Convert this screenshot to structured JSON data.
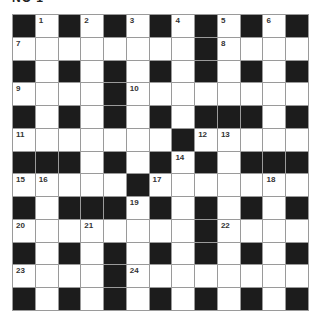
{
  "title": "NO 1",
  "colors": {
    "block": "#1c1c1c",
    "cell": "#ffffff",
    "gridline": "#9a9a9a"
  },
  "grid": {
    "rows": 13,
    "cols": 13,
    "pattern": [
      "BWBWBWBWBWBWB",
      "WWWWWWWWBWWWW",
      "BWBWBWBWBWBWB",
      "WWWWBWWWWWWWW",
      "BWBWBWBWBBBWB",
      "WWWWWWWBWWWWW",
      "BBBWBWBWBWBBB",
      "WWWWWBWWWWWWW",
      "BWBBBWBWBWBWB",
      "WWWWWWWWBWWWW",
      "BWBWBWBWBWBWB",
      "WWWWBWWWWWWWW",
      "BWBWBWBWBWBWB"
    ],
    "numbers": [
      {
        "n": "1",
        "r": 0,
        "c": 1
      },
      {
        "n": "2",
        "r": 0,
        "c": 3
      },
      {
        "n": "3",
        "r": 0,
        "c": 5
      },
      {
        "n": "4",
        "r": 0,
        "c": 7
      },
      {
        "n": "5",
        "r": 0,
        "c": 9
      },
      {
        "n": "6",
        "r": 0,
        "c": 11
      },
      {
        "n": "7",
        "r": 1,
        "c": 0
      },
      {
        "n": "8",
        "r": 1,
        "c": 9
      },
      {
        "n": "9",
        "r": 3,
        "c": 0
      },
      {
        "n": "10",
        "r": 3,
        "c": 5
      },
      {
        "n": "11",
        "r": 5,
        "c": 0
      },
      {
        "n": "12",
        "r": 5,
        "c": 8
      },
      {
        "n": "13",
        "r": 5,
        "c": 9
      },
      {
        "n": "14",
        "r": 6,
        "c": 7
      },
      {
        "n": "15",
        "r": 7,
        "c": 0
      },
      {
        "n": "16",
        "r": 7,
        "c": 1
      },
      {
        "n": "17",
        "r": 7,
        "c": 6
      },
      {
        "n": "18",
        "r": 7,
        "c": 11
      },
      {
        "n": "19",
        "r": 8,
        "c": 5
      },
      {
        "n": "20",
        "r": 9,
        "c": 0
      },
      {
        "n": "21",
        "r": 9,
        "c": 3
      },
      {
        "n": "22",
        "r": 9,
        "c": 9
      },
      {
        "n": "23",
        "r": 11,
        "c": 0
      },
      {
        "n": "24",
        "r": 11,
        "c": 5
      }
    ]
  }
}
